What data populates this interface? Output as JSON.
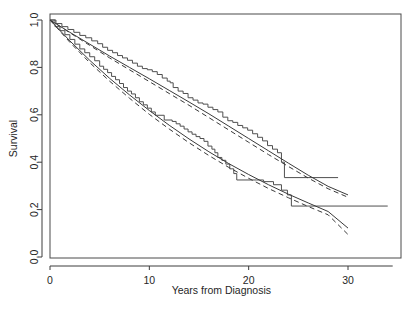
{
  "chart_data": {
    "type": "line",
    "title": "",
    "subtitle": "",
    "xlabel": "Years from Diagnosis",
    "ylabel": "Survival",
    "xlim": [
      0,
      34.5
    ],
    "ylim": [
      0.0,
      1.0
    ],
    "xticks": [
      0,
      10,
      20,
      30
    ],
    "xticklabels": [
      "0",
      "10",
      "20",
      "30"
    ],
    "yticks": [
      0.0,
      0.2,
      0.4,
      0.6,
      0.8,
      1.0
    ],
    "yticklabels": [
      "0.0",
      "0.2",
      "0.4",
      "0.6",
      "0.8",
      "1.0"
    ],
    "grid": false,
    "legend": "none",
    "series": [
      {
        "name": "Group 1 Kaplan-Meier (upper step)",
        "style": "step",
        "linestyle": "solid",
        "color": "#4f4f4f",
        "x": [
          0,
          0.6,
          1.2,
          1.8,
          2.4,
          3.0,
          3.6,
          4.2,
          4.8,
          5.3,
          5.8,
          6.3,
          6.8,
          7.3,
          7.8,
          8.3,
          8.8,
          9.3,
          9.8,
          10.3,
          10.8,
          11.3,
          11.8,
          12.1,
          12.4,
          12.9,
          13.4,
          13.9,
          14.4,
          14.9,
          15.4,
          15.9,
          16.4,
          16.9,
          17.4,
          17.9,
          18.4,
          18.9,
          19.4,
          19.9,
          20.4,
          20.9,
          21.4,
          21.9,
          22.4,
          22.9,
          23.3,
          23.6,
          29.0
        ],
        "y": [
          1.0,
          0.985,
          0.972,
          0.96,
          0.948,
          0.935,
          0.925,
          0.912,
          0.9,
          0.885,
          0.872,
          0.862,
          0.85,
          0.84,
          0.83,
          0.818,
          0.805,
          0.795,
          0.79,
          0.782,
          0.77,
          0.755,
          0.742,
          0.735,
          0.715,
          0.7,
          0.69,
          0.672,
          0.662,
          0.65,
          0.645,
          0.632,
          0.622,
          0.612,
          0.59,
          0.575,
          0.568,
          0.555,
          0.545,
          0.535,
          0.52,
          0.505,
          0.49,
          0.47,
          0.455,
          0.44,
          0.4,
          0.335,
          0.335
        ]
      },
      {
        "name": "Group 1 fitted (solid)",
        "style": "smooth",
        "linestyle": "solid",
        "color": "#3a3a3a",
        "x": [
          0,
          2,
          4,
          6,
          8,
          10,
          12,
          14,
          16,
          18,
          20,
          22,
          24,
          26,
          28,
          30
        ],
        "y": [
          1.0,
          0.948,
          0.898,
          0.848,
          0.8,
          0.752,
          0.703,
          0.654,
          0.604,
          0.552,
          0.5,
          0.448,
          0.396,
          0.345,
          0.298,
          0.262
        ]
      },
      {
        "name": "Group 1 fitted (dashed)",
        "style": "smooth",
        "linestyle": "dashed",
        "color": "#3a3a3a",
        "x": [
          0,
          2,
          4,
          6,
          8,
          10,
          12,
          14,
          16,
          18,
          20,
          22,
          24,
          26,
          28,
          30
        ],
        "y": [
          1.0,
          0.946,
          0.893,
          0.84,
          0.79,
          0.74,
          0.69,
          0.64,
          0.588,
          0.536,
          0.484,
          0.432,
          0.382,
          0.333,
          0.288,
          0.252
        ]
      },
      {
        "name": "Group 2 Kaplan-Meier (lower step)",
        "style": "step",
        "linestyle": "solid",
        "color": "#4f4f4f",
        "x": [
          0,
          0.5,
          1.0,
          1.5,
          2.0,
          2.5,
          3.0,
          3.5,
          4.0,
          4.5,
          5.0,
          5.4,
          5.8,
          6.2,
          6.6,
          7.0,
          7.4,
          7.8,
          8.2,
          8.6,
          9.0,
          9.4,
          9.8,
          10.2,
          10.6,
          11.5,
          12.3,
          12.7,
          13.1,
          13.5,
          13.9,
          14.3,
          14.7,
          15.1,
          15.5,
          15.9,
          16.3,
          16.6,
          16.9,
          17.3,
          17.7,
          18.1,
          18.5,
          18.8,
          20.8,
          21.5,
          22.5,
          23.3,
          23.9,
          24.3,
          34.0
        ],
        "y": [
          1.0,
          0.972,
          0.955,
          0.938,
          0.918,
          0.898,
          0.878,
          0.862,
          0.845,
          0.828,
          0.805,
          0.792,
          0.778,
          0.762,
          0.748,
          0.732,
          0.715,
          0.7,
          0.688,
          0.672,
          0.655,
          0.642,
          0.628,
          0.612,
          0.598,
          0.578,
          0.572,
          0.562,
          0.552,
          0.54,
          0.528,
          0.518,
          0.508,
          0.5,
          0.488,
          0.468,
          0.455,
          0.44,
          0.42,
          0.408,
          0.392,
          0.372,
          0.352,
          0.325,
          0.325,
          0.318,
          0.305,
          0.282,
          0.262,
          0.215,
          0.215
        ]
      },
      {
        "name": "Group 2 fitted (solid)",
        "style": "smooth",
        "linestyle": "solid",
        "color": "#3a3a3a",
        "x": [
          0,
          2,
          4,
          6,
          8,
          10,
          12,
          14,
          16,
          18,
          20,
          22,
          24,
          26,
          28,
          30
        ],
        "y": [
          1.0,
          0.912,
          0.83,
          0.754,
          0.684,
          0.618,
          0.556,
          0.498,
          0.444,
          0.394,
          0.348,
          0.305,
          0.265,
          0.228,
          0.192,
          0.122
        ]
      },
      {
        "name": "Group 2 fitted (dashed)",
        "style": "smooth",
        "linestyle": "dashed",
        "color": "#3a3a3a",
        "x": [
          0,
          2,
          4,
          6,
          8,
          10,
          12,
          14,
          16,
          18,
          20,
          22,
          24,
          26,
          28,
          30
        ],
        "y": [
          1.0,
          0.906,
          0.82,
          0.742,
          0.67,
          0.602,
          0.54,
          0.482,
          0.428,
          0.378,
          0.332,
          0.289,
          0.25,
          0.213,
          0.178,
          0.095
        ]
      }
    ]
  }
}
